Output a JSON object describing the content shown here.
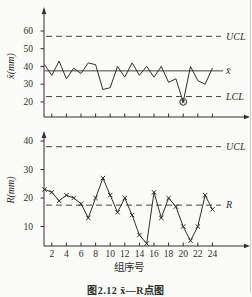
{
  "figure": {
    "caption": "图2.12  x̄—R点图",
    "xaxis_title": "组序号",
    "x_tick_labels": [
      "2",
      "4",
      "6",
      "8",
      "10",
      "12",
      "14",
      "16",
      "18",
      "20",
      "22",
      "24"
    ],
    "groups_count": 24
  },
  "chart_data": [
    {
      "type": "line",
      "name": "xbar-chart",
      "ylabel": "x̄(mm)",
      "xlabel": "",
      "x": [
        1,
        2,
        3,
        4,
        5,
        6,
        7,
        8,
        9,
        10,
        11,
        12,
        13,
        14,
        15,
        16,
        17,
        18,
        19,
        20,
        21,
        22,
        23,
        24
      ],
      "series": [
        {
          "name": "xbar",
          "marker": "none",
          "values": [
            41,
            35,
            43,
            33,
            39,
            36,
            42,
            41,
            27,
            28,
            40,
            34,
            42,
            35,
            40,
            34,
            40,
            31,
            33,
            20,
            40,
            32,
            30,
            39
          ]
        }
      ],
      "yticks": [
        60,
        50,
        40,
        30,
        20
      ],
      "ylim": [
        15,
        66
      ],
      "xlim": [
        0,
        25
      ],
      "grid": false,
      "control_lines": [
        {
          "label": "UCL",
          "value": 57,
          "style": "dashed"
        },
        {
          "label": "x̄",
          "value": 37.5,
          "style": "solid"
        },
        {
          "label": "LCL",
          "value": 23,
          "style": "dashed"
        }
      ],
      "out_of_control_point": {
        "group": 20,
        "value": 20,
        "marker": "circled"
      }
    },
    {
      "type": "line",
      "name": "r-chart",
      "ylabel": "R(mm)",
      "xlabel": "组序号",
      "x": [
        1,
        2,
        3,
        4,
        5,
        6,
        7,
        8,
        9,
        10,
        11,
        12,
        13,
        14,
        15,
        16,
        17,
        18,
        19,
        20,
        21,
        22,
        23,
        24
      ],
      "series": [
        {
          "name": "R",
          "marker": "x",
          "values": [
            23,
            22,
            19,
            21,
            20,
            18,
            13,
            20,
            27,
            21,
            15,
            20,
            14,
            7,
            4,
            22,
            13,
            20,
            17,
            10,
            5,
            10,
            21,
            16
          ]
        }
      ],
      "yticks": [
        40,
        30,
        20,
        10
      ],
      "ylim": [
        0,
        45
      ],
      "xlim": [
        0,
        25
      ],
      "grid": false,
      "control_lines": [
        {
          "label": "UCL",
          "value": 38,
          "style": "dashed"
        },
        {
          "label": "R",
          "value": 17.5,
          "style": "dashed"
        }
      ]
    }
  ],
  "style": {
    "ink_color": "#2e2e2e",
    "background_color": "#fbfbf8"
  }
}
